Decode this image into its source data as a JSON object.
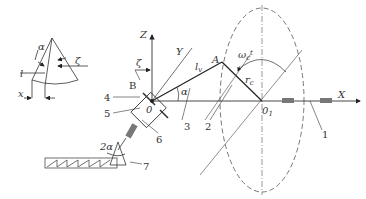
{
  "diagram": {
    "inset": {
      "labels": {
        "alpha": "α",
        "l": "l",
        "zeta": "ζ",
        "x": "x"
      }
    },
    "main": {
      "axis_labels": {
        "Z": "Z",
        "Y": "Y",
        "X": "X"
      },
      "point_labels": {
        "A": "A",
        "B": "B",
        "O": "0",
        "O1": "0",
        "O1_sub": "1"
      },
      "symbols": {
        "zeta": "ζ",
        "alpha": "α",
        "lv": "l",
        "lv_sub": "v",
        "omega": "ω",
        "omega_sub": "c",
        "omega_t": "t",
        "r": "r",
        "r_sub": "c",
        "two_alpha": "2α"
      },
      "callouts": [
        "1",
        "2",
        "3",
        "4",
        "5",
        "6",
        "7"
      ]
    }
  }
}
